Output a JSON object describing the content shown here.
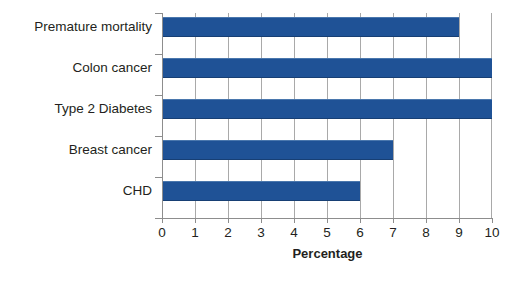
{
  "chart_data": {
    "type": "bar",
    "orientation": "horizontal",
    "title": "",
    "xlabel": "Percentage",
    "ylabel": "",
    "xlim": [
      0,
      10
    ],
    "xticks": [
      "0",
      "1",
      "2",
      "3",
      "4",
      "5",
      "6",
      "7",
      "8",
      "9",
      "10"
    ],
    "grid": "vertical",
    "legend": "none",
    "categories": [
      "Premature mortality",
      "Colon cancer",
      "Type 2 Diabetes",
      "Breast cancer",
      "CHD"
    ],
    "values": [
      9,
      10,
      10,
      7,
      6
    ],
    "bar_color": "#1f5296",
    "gridline_color": "#a9a9a9",
    "axis_color": "#8d8d8d",
    "background_color": "#ffffff",
    "text_color": "#231f20"
  }
}
